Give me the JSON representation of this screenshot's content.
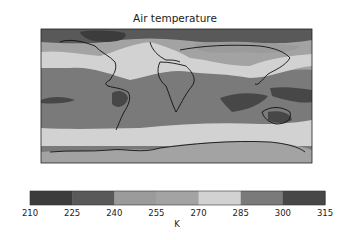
{
  "chart_data": {
    "type": "heatmap",
    "title": "Air temperature",
    "projection": "global map (PlateCarree)",
    "colorbar": {
      "label": "K",
      "orientation": "horizontal",
      "placement": "bottom",
      "ticks": [
        210,
        225,
        240,
        255,
        270,
        285,
        300,
        315
      ],
      "levels": [
        {
          "min": 210,
          "max": 225,
          "color": "#3c3c3c"
        },
        {
          "min": 225,
          "max": 240,
          "color": "#595959"
        },
        {
          "min": 240,
          "max": 255,
          "color": "#9b9b9b"
        },
        {
          "min": 255,
          "max": 270,
          "color": "#a3a3a3"
        },
        {
          "min": 270,
          "max": 285,
          "color": "#d2d2d2"
        },
        {
          "min": 285,
          "max": 300,
          "color": "#7a7a7a"
        },
        {
          "min": 300,
          "max": 315,
          "color": "#474747"
        }
      ],
      "range": [
        210,
        315
      ]
    },
    "regions": [
      {
        "name": "Arctic / Greenland",
        "band": "210-240"
      },
      {
        "name": "Northern mid-latitudes (N. America, Eurasia)",
        "band": "240-270"
      },
      {
        "name": "Northern subtropics belt",
        "band": "270-285"
      },
      {
        "name": "Tropics / oceans",
        "band": "285-300"
      },
      {
        "name": "Amazon, Sahel, Indian Ocean, Maritime continent, N. Australia",
        "band": "300-315"
      },
      {
        "name": "Southern Ocean belt",
        "band": "270-285"
      },
      {
        "name": "Antarctica",
        "band": "240-270"
      }
    ]
  }
}
